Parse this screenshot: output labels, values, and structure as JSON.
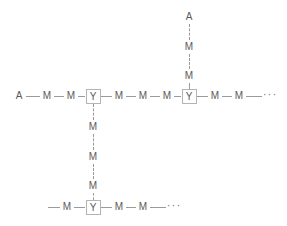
{
  "diagram": {
    "colors": {
      "bond": "#9a9a9a",
      "label": "#5a5a5a",
      "box_border": "#b4b4b4",
      "background": "#ffffff"
    },
    "labels": {
      "terminal": "A",
      "monomer": "M",
      "junction": "Y",
      "ellipsis": "···"
    },
    "main_chain": {
      "name": "main-horizontal-chain",
      "sequence": [
        "A",
        "M",
        "M",
        "Y",
        "M",
        "M",
        "M",
        "Y",
        "M",
        "M",
        "···"
      ],
      "nodes": [
        {
          "label": "A",
          "kind": "terminal",
          "x": 19,
          "y": 96
        },
        {
          "label": "M",
          "kind": "monomer",
          "x": 47,
          "y": 96
        },
        {
          "label": "M",
          "kind": "monomer",
          "x": 71,
          "y": 96
        },
        {
          "label": "Y",
          "kind": "junction",
          "x": 93,
          "y": 96
        },
        {
          "label": "M",
          "kind": "monomer",
          "x": 119,
          "y": 96
        },
        {
          "label": "M",
          "kind": "monomer",
          "x": 143,
          "y": 96
        },
        {
          "label": "M",
          "kind": "monomer",
          "x": 167,
          "y": 96
        },
        {
          "label": "Y",
          "kind": "junction",
          "x": 189,
          "y": 96
        },
        {
          "label": "M",
          "kind": "monomer",
          "x": 215,
          "y": 96
        },
        {
          "label": "M",
          "kind": "monomer",
          "x": 239,
          "y": 96
        }
      ],
      "ellipsis": {
        "x": 265,
        "y": 96
      },
      "tail_bond": {
        "x1": 246,
        "x2": 262,
        "y": 96
      }
    },
    "upper_branch": {
      "name": "upper-vertical-branch",
      "from_junction": "Y (main chain, position 8)",
      "sequence": [
        "A",
        "M",
        "M"
      ],
      "nodes": [
        {
          "label": "A",
          "kind": "terminal",
          "x": 189,
          "y": 17
        },
        {
          "label": "M",
          "kind": "monomer",
          "x": 189,
          "y": 47
        },
        {
          "label": "M",
          "kind": "monomer",
          "x": 189,
          "y": 76
        }
      ]
    },
    "lower_branch": {
      "name": "lower-vertical-branch",
      "from_junction": "Y (main chain, position 4)",
      "sequence": [
        "M",
        "M",
        "M"
      ],
      "nodes": [
        {
          "label": "M",
          "kind": "monomer",
          "x": 93,
          "y": 127
        },
        {
          "label": "M",
          "kind": "monomer",
          "x": 93,
          "y": 157
        },
        {
          "label": "M",
          "kind": "monomer",
          "x": 93,
          "y": 186
        }
      ]
    },
    "bottom_chain": {
      "name": "bottom-horizontal-chain",
      "sequence": [
        "M",
        "Y",
        "M",
        "M",
        "···"
      ],
      "lead_bond": {
        "x1": 48,
        "x2": 60,
        "y": 207
      },
      "nodes": [
        {
          "label": "M",
          "kind": "monomer",
          "x": 67,
          "y": 207
        },
        {
          "label": "Y",
          "kind": "junction",
          "x": 93,
          "y": 207
        },
        {
          "label": "M",
          "kind": "monomer",
          "x": 119,
          "y": 207
        },
        {
          "label": "M",
          "kind": "monomer",
          "x": 143,
          "y": 207
        }
      ],
      "ellipsis": {
        "x": 169,
        "y": 207
      },
      "tail_bond": {
        "x1": 150,
        "x2": 166,
        "y": 207
      }
    }
  }
}
